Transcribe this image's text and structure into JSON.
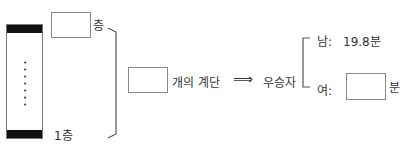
{
  "diagram": {
    "top_floor_label": "층",
    "bottom_floor_label": "1층",
    "stairs_text": "개의 계단",
    "arrow_symbol": "⟹",
    "winner_label": "우승자",
    "male_label": "남:",
    "male_time": "19.8분",
    "female_label": "여:",
    "female_unit": "분",
    "tower_dots": "• • • • • • •"
  }
}
